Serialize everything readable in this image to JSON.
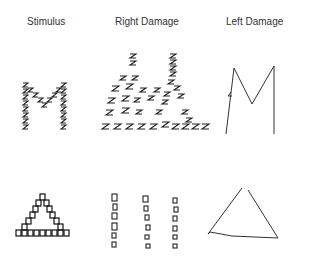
{
  "figure": {
    "columns": [
      {
        "label": "Stimulus"
      },
      {
        "label": "Right Damage"
      },
      {
        "label": "Left Damage"
      }
    ],
    "rows": [
      {
        "stimulus": "Global letter M made of local Z letters",
        "right_damage": "Scattered local Z letters, global M shape lost",
        "left_damage": "Global M drawn without local Z detail"
      },
      {
        "stimulus": "Global triangle made of local small squares",
        "right_damage": "Columns of local squares, global triangle lost",
        "left_damage": "Global triangle drawn without local square detail"
      }
    ]
  }
}
